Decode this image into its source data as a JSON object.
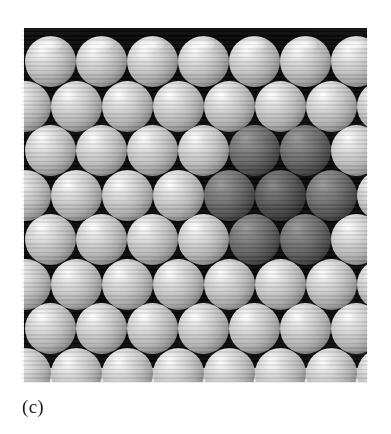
{
  "figure": {
    "caption": "(c)",
    "panel_label": "close-packed-sphere-model",
    "panel": {
      "x": 22,
      "y": 28,
      "width": 346,
      "height": 356,
      "background_color": "#080808"
    },
    "colors": {
      "page_background": "#ffffff",
      "interstice": "#080808",
      "matrix_sphere_highlight": "#ffffff",
      "matrix_sphere_mid": "#c0c0c0",
      "matrix_sphere_rim": "#141414",
      "impurity_sphere_highlight": "#9b9b9b",
      "impurity_sphere_mid": "#686868",
      "impurity_sphere_rim": "#070707",
      "caption_color": "#1b1b1b"
    },
    "lattice": {
      "type": "hexagonal-close-packed-2d",
      "sphere_diameter": 51,
      "row_pitch": 44.5,
      "column_pitch": 51,
      "row_count": 9,
      "spheres_per_row": 8,
      "stagger_offset": 25.5
    },
    "rows": [
      {
        "index": 0,
        "y": 8,
        "x_offset": 3,
        "count": 8,
        "dark_columns": []
      },
      {
        "index": 1,
        "y": 52.5,
        "x_offset": -22.5,
        "count": 8,
        "dark_columns": []
      },
      {
        "index": 2,
        "y": 97,
        "x_offset": 3,
        "count": 8,
        "dark_columns": [
          4,
          5
        ]
      },
      {
        "index": 3,
        "y": 141.5,
        "x_offset": -22.5,
        "count": 8,
        "dark_columns": [
          4,
          5,
          6
        ]
      },
      {
        "index": 4,
        "y": 186,
        "x_offset": 3,
        "count": 8,
        "dark_columns": [
          4,
          5
        ]
      },
      {
        "index": 5,
        "y": 230.5,
        "x_offset": -22.5,
        "count": 8,
        "dark_columns": []
      },
      {
        "index": 6,
        "y": 275,
        "x_offset": 3,
        "count": 8,
        "dark_columns": []
      },
      {
        "index": 7,
        "y": 319.5,
        "x_offset": -22.5,
        "count": 8,
        "dark_columns": []
      },
      {
        "index": 8,
        "y": 340,
        "x_offset": 3,
        "count": 8,
        "dark_columns": []
      }
    ],
    "impurity_cluster": {
      "label": "impurity-cluster",
      "shape": "hexagonal",
      "sphere_count": 7,
      "center_row": 3,
      "center_column": 5
    }
  }
}
